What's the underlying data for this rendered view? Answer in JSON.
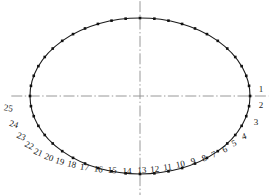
{
  "figure": {
    "background_color": "#ffffff",
    "curve_color": "#1a1a1a",
    "marker_color": "#111111",
    "axis_color": "#8d8d8d",
    "label_color": "#1a1a1a"
  },
  "chart_data": {
    "type": "scatter",
    "title": "",
    "subtitle": "",
    "xlabel": "",
    "ylabel": "",
    "grid": false,
    "legend": null,
    "xlim": [
      -1.18,
      1.18
    ],
    "ylim": [
      -1.18,
      1.18
    ],
    "shape": {
      "kind": "ellipse",
      "center": [
        0,
        0
      ],
      "semi_major_x": 1.0,
      "semi_minor_y": 0.8125,
      "node_count": 48
    },
    "axes_lines": [
      {
        "name": "horizontal-centerline",
        "orientation": "horizontal",
        "style": "dash-dot",
        "from": [
          -1.17,
          0
        ],
        "to": [
          1.17,
          0
        ]
      },
      {
        "name": "vertical-centerline",
        "orientation": "vertical",
        "style": "dash-dot",
        "from": [
          0,
          -1.12
        ],
        "to": [
          0,
          1.12
        ]
      }
    ],
    "labeled_nodes": [
      {
        "label": "1",
        "angle_deg": 0
      },
      {
        "label": "2",
        "angle_deg": -15
      },
      {
        "label": "3",
        "angle_deg": -30
      },
      {
        "label": "4",
        "angle_deg": -45
      },
      {
        "label": "5",
        "angle_deg": -60
      },
      {
        "label": "6",
        "angle_deg": -75
      },
      {
        "label": "7",
        "angle_deg": -90
      },
      {
        "label": "8",
        "angle_deg": -105
      },
      {
        "label": "9",
        "angle_deg": -118
      },
      {
        "label": "10",
        "angle_deg": -131
      },
      {
        "label": "11",
        "angle_deg": -144
      },
      {
        "label": "12",
        "angle_deg": -157
      },
      {
        "label": "13",
        "angle_deg": -170
      },
      {
        "label": "14",
        "angle_deg": -183
      },
      {
        "label": "15",
        "angle_deg": -196
      },
      {
        "label": "16",
        "angle_deg": -209
      },
      {
        "label": "17",
        "angle_deg": -222
      },
      {
        "label": "18",
        "angle_deg": -235
      },
      {
        "label": "19",
        "angle_deg": -247
      },
      {
        "label": "20",
        "angle_deg": -259
      },
      {
        "label": "21",
        "angle_deg": -271
      },
      {
        "label": "22",
        "angle_deg": -283
      },
      {
        "label": "23",
        "angle_deg": -295
      },
      {
        "label": "24",
        "angle_deg": -310
      },
      {
        "label": "25",
        "angle_deg": -340
      }
    ],
    "label_positions": [
      {
        "label": "1",
        "x": 261,
        "y": 92,
        "rotate": 0
      },
      {
        "label": "2",
        "x": 261,
        "y": 108,
        "rotate": 0
      },
      {
        "label": "3",
        "x": 256,
        "y": 125,
        "rotate": 0
      },
      {
        "label": "4",
        "x": 245,
        "y": 139,
        "rotate": -18
      },
      {
        "label": "5",
        "x": 235,
        "y": 146,
        "rotate": -22
      },
      {
        "label": "6",
        "x": 226,
        "y": 152,
        "rotate": -26
      },
      {
        "label": "7",
        "x": 215,
        "y": 157,
        "rotate": -24
      },
      {
        "label": "8",
        "x": 205,
        "y": 161,
        "rotate": -20
      },
      {
        "label": "9",
        "x": 194,
        "y": 164,
        "rotate": -16
      },
      {
        "label": "10",
        "x": 181,
        "y": 167,
        "rotate": -12
      },
      {
        "label": "11",
        "x": 168,
        "y": 170,
        "rotate": -8
      },
      {
        "label": "12",
        "x": 155,
        "y": 172,
        "rotate": -5
      },
      {
        "label": "13",
        "x": 142,
        "y": 173,
        "rotate": -2
      },
      {
        "label": "14",
        "x": 127,
        "y": 174,
        "rotate": 0
      },
      {
        "label": "15",
        "x": 112,
        "y": 173,
        "rotate": 4
      },
      {
        "label": "16",
        "x": 98,
        "y": 172,
        "rotate": 7
      },
      {
        "label": "17",
        "x": 84,
        "y": 170,
        "rotate": 10
      },
      {
        "label": "18",
        "x": 71,
        "y": 167,
        "rotate": 14
      },
      {
        "label": "19",
        "x": 59,
        "y": 164,
        "rotate": 17
      },
      {
        "label": "20",
        "x": 48,
        "y": 160,
        "rotate": 20
      },
      {
        "label": "21",
        "x": 37,
        "y": 155,
        "rotate": 24
      },
      {
        "label": "22",
        "x": 28,
        "y": 148,
        "rotate": 27
      },
      {
        "label": "23",
        "x": 20,
        "y": 139,
        "rotate": 24
      },
      {
        "label": "24",
        "x": 13,
        "y": 127,
        "rotate": 16
      },
      {
        "label": "25",
        "x": 8,
        "y": 111,
        "rotate": 8
      }
    ]
  }
}
